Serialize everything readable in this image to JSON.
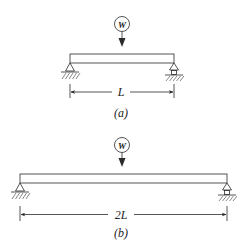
{
  "figure": {
    "panels": [
      {
        "id": "a",
        "caption": "(a)",
        "load_label": "W",
        "span_label": "L",
        "beam": {
          "x1": 70,
          "x2": 174,
          "y_top": 54,
          "y_bottom": 63
        },
        "supports": {
          "left": "pin",
          "right": "roller"
        }
      },
      {
        "id": "b",
        "caption": "(b)",
        "load_label": "W",
        "span_label": "2L",
        "beam": {
          "x1": 20,
          "x2": 227,
          "y_top": 174,
          "y_bottom": 183
        },
        "supports": {
          "left": "pin",
          "right": "roller"
        }
      }
    ],
    "colors": {
      "line": "#2a2a2a",
      "hatch": "#6a6a6a",
      "background": "#ffffff"
    }
  }
}
